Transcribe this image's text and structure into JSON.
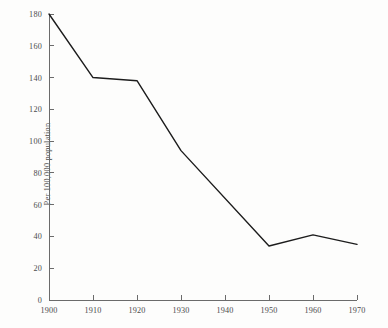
{
  "chart_data": {
    "type": "line",
    "title": "",
    "subtitle": "",
    "xlabel": "",
    "ylabel": "Per 100,000 population",
    "x": [
      1900,
      1910,
      1920,
      1930,
      1950,
      1960,
      1970
    ],
    "values": [
      180,
      140,
      138,
      94,
      34,
      41,
      35
    ],
    "series": [
      {
        "name": "Rate per 100,000 population",
        "values": [
          180,
          140,
          138,
          94,
          34,
          41,
          35
        ]
      }
    ],
    "xlim": [
      1900,
      1970
    ],
    "ylim": [
      0,
      180
    ],
    "xticks": [
      1900,
      1910,
      1920,
      1930,
      1940,
      1950,
      1960,
      1970
    ],
    "xtick_labels": [
      "1900",
      "1910",
      "1920",
      "1930",
      "1940",
      "1950",
      "1960",
      "1970"
    ],
    "yticks": [
      0,
      20,
      40,
      60,
      80,
      100,
      120,
      140,
      160,
      180
    ],
    "ytick_labels": [
      "0",
      "20",
      "40",
      "60",
      "80",
      "100",
      "120",
      "140",
      "160",
      "180"
    ],
    "grid": false,
    "legend": false,
    "legend_position": "none",
    "annotations": [],
    "line_color": "#1c1c1c",
    "axis_color": "#6b6b6b",
    "background_color": "#fdfdfc",
    "text_color": "#4c4c4c"
  },
  "axis_titles": {
    "y": "Per 100,000 population"
  }
}
